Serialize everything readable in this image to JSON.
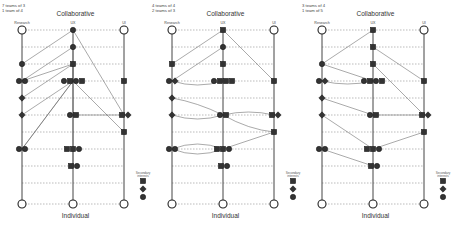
{
  "diagram": {
    "columns": [
      "Research",
      "UX",
      "UI"
    ],
    "top_label": "Collaborative",
    "bottom_label": "Individual",
    "legend": {
      "title": "Secondary interests",
      "shapes": [
        "square",
        "diamond",
        "circle"
      ]
    },
    "colors": {
      "node": "#333333",
      "line": "#555555",
      "dash": "#777777",
      "hollow_fill": "#ffffff"
    }
  },
  "panels": [
    {
      "teams_line1": "7 teams of 3",
      "teams_line2": "1 team of 4",
      "top_label": "Collaborative",
      "bottom_label": "Individual",
      "col_labels": [
        "Research",
        "UX",
        "UI"
      ],
      "legend_title": "Secondary interests",
      "nodes": [
        {
          "r": 1,
          "c": 1,
          "s": "circle",
          "dx": 0
        },
        {
          "r": 2,
          "c": 0,
          "s": "circle",
          "dx": 0
        },
        {
          "r": 2,
          "c": 1,
          "s": "square",
          "dx": 0
        },
        {
          "r": 3,
          "c": 0,
          "s": "circle",
          "dx": -3
        },
        {
          "r": 3,
          "c": 0,
          "s": "circle",
          "dx": 3
        },
        {
          "r": 3,
          "c": 1,
          "s": "circle",
          "dx": -9
        },
        {
          "r": 3,
          "c": 1,
          "s": "square",
          "dx": -3
        },
        {
          "r": 3,
          "c": 1,
          "s": "circle",
          "dx": 3
        },
        {
          "r": 3,
          "c": 1,
          "s": "square",
          "dx": 9
        },
        {
          "r": 3,
          "c": 2,
          "s": "square",
          "dx": 0
        },
        {
          "r": 4,
          "c": 0,
          "s": "diamond",
          "dx": 0
        },
        {
          "r": 5,
          "c": 0,
          "s": "diamond",
          "dx": 0
        },
        {
          "r": 5,
          "c": 1,
          "s": "circle",
          "dx": -3
        },
        {
          "r": 5,
          "c": 1,
          "s": "square",
          "dx": 3
        },
        {
          "r": 5,
          "c": 2,
          "s": "square",
          "dx": -2
        },
        {
          "r": 5,
          "c": 2,
          "s": "diamond",
          "dx": 4
        },
        {
          "r": 6,
          "c": 2,
          "s": "square",
          "dx": 0
        },
        {
          "r": 7,
          "c": 0,
          "s": "circle",
          "dx": -3
        },
        {
          "r": 7,
          "c": 0,
          "s": "circle",
          "dx": 3
        },
        {
          "r": 7,
          "c": 1,
          "s": "square",
          "dx": -6
        },
        {
          "r": 7,
          "c": 1,
          "s": "square",
          "dx": 0
        },
        {
          "r": 7,
          "c": 1,
          "s": "circle",
          "dx": 6
        },
        {
          "r": 8,
          "c": 1,
          "s": "square",
          "dx": -2
        },
        {
          "r": 8,
          "c": 1,
          "s": "circle",
          "dx": 4
        }
      ],
      "links": [
        {
          "a": [
            0,
            1
          ],
          "b": [
            2,
            0
          ]
        },
        {
          "a": [
            1,
            1
          ],
          "b": [
            3,
            0
          ]
        },
        {
          "a": [
            1,
            1
          ],
          "b": [
            3,
            1
          ]
        },
        {
          "a": [
            0,
            1
          ],
          "b": [
            5,
            2
          ]
        },
        {
          "a": [
            2,
            1
          ],
          "b": [
            3,
            0
          ]
        },
        {
          "a": [
            2,
            1
          ],
          "b": [
            4,
            0
          ]
        },
        {
          "a": [
            3,
            1
          ],
          "b": [
            6,
            2
          ]
        },
        {
          "a": [
            3,
            1
          ],
          "b": [
            5,
            0
          ]
        },
        {
          "a": [
            3,
            1
          ],
          "b": [
            7,
            0
          ]
        },
        {
          "a": [
            2,
            1
          ],
          "b": [
            8,
            1
          ]
        },
        {
          "a": [
            5,
            1
          ],
          "b": [
            5,
            2
          ]
        },
        {
          "a": [
            3,
            1
          ],
          "b": [
            7,
            0
          ]
        }
      ]
    },
    {
      "teams_line1": "4 teams of 4",
      "teams_line2": "2 teams of 3",
      "top_label": "Collaborative",
      "bottom_label": "Individual",
      "col_labels": [
        "Research",
        "UX",
        "UI"
      ],
      "legend_title": "Secondary interests",
      "nodes": [
        {
          "r": 1,
          "c": 1,
          "s": "circle",
          "dx": 0
        },
        {
          "r": 2,
          "c": 0,
          "s": "square",
          "dx": 0
        },
        {
          "r": 2,
          "c": 1,
          "s": "square",
          "dx": 0
        },
        {
          "r": 3,
          "c": 0,
          "s": "circle",
          "dx": -3
        },
        {
          "r": 3,
          "c": 0,
          "s": "diamond",
          "dx": 3
        },
        {
          "r": 3,
          "c": 1,
          "s": "circle",
          "dx": -9
        },
        {
          "r": 3,
          "c": 1,
          "s": "square",
          "dx": -3
        },
        {
          "r": 3,
          "c": 1,
          "s": "square",
          "dx": 3
        },
        {
          "r": 3,
          "c": 1,
          "s": "square",
          "dx": 9
        },
        {
          "r": 3,
          "c": 2,
          "s": "square",
          "dx": 0
        },
        {
          "r": 4,
          "c": 0,
          "s": "diamond",
          "dx": 0
        },
        {
          "r": 5,
          "c": 0,
          "s": "diamond",
          "dx": 0
        },
        {
          "r": 5,
          "c": 1,
          "s": "circle",
          "dx": -3
        },
        {
          "r": 5,
          "c": 1,
          "s": "square",
          "dx": 3
        },
        {
          "r": 5,
          "c": 2,
          "s": "square",
          "dx": -2
        },
        {
          "r": 5,
          "c": 2,
          "s": "diamond",
          "dx": 4
        },
        {
          "r": 6,
          "c": 2,
          "s": "square",
          "dx": 0
        },
        {
          "r": 7,
          "c": 0,
          "s": "circle",
          "dx": -3
        },
        {
          "r": 7,
          "c": 0,
          "s": "circle",
          "dx": 3
        },
        {
          "r": 7,
          "c": 1,
          "s": "square",
          "dx": -6
        },
        {
          "r": 7,
          "c": 1,
          "s": "square",
          "dx": 0
        },
        {
          "r": 7,
          "c": 1,
          "s": "circle",
          "dx": 6
        },
        {
          "r": 8,
          "c": 1,
          "s": "square",
          "dx": -2
        },
        {
          "r": 8,
          "c": 1,
          "s": "circle",
          "dx": 4
        }
      ],
      "links": [
        {
          "a": [
            0,
            1
          ],
          "b": [
            2,
            0
          ]
        },
        {
          "a": [
            1,
            1
          ],
          "b": [
            3,
            0
          ]
        },
        {
          "a": [
            0,
            1
          ],
          "b": [
            3,
            2
          ]
        },
        {
          "a": [
            3,
            0
          ],
          "b": [
            3,
            1
          ],
          "curve": 8
        },
        {
          "a": [
            4,
            0
          ],
          "b": [
            5,
            1
          ],
          "curve": -4
        },
        {
          "a": [
            5,
            1
          ],
          "b": [
            5,
            2
          ],
          "curve": -6
        },
        {
          "a": [
            5,
            0
          ],
          "b": [
            5,
            1
          ],
          "curve": 8
        },
        {
          "a": [
            5,
            1
          ],
          "b": [
            6,
            2
          ],
          "curve": 6
        },
        {
          "a": [
            7,
            0
          ],
          "b": [
            7,
            1
          ],
          "curve": -10
        },
        {
          "a": [
            7,
            0
          ],
          "b": [
            7,
            1
          ],
          "curve": 10
        },
        {
          "a": [
            6,
            2
          ],
          "b": [
            7,
            1
          ]
        }
      ]
    },
    {
      "teams_line1": "3 teams of 4",
      "teams_line2": "1 team of 5",
      "top_label": "Collaborative",
      "bottom_label": "Individual",
      "col_labels": [
        "Research",
        "UX",
        "UI"
      ],
      "legend_title": "Secondary interests",
      "nodes": [
        {
          "r": 1,
          "c": 1,
          "s": "square",
          "dx": 0
        },
        {
          "r": 2,
          "c": 0,
          "s": "circle",
          "dx": 0
        },
        {
          "r": 2,
          "c": 1,
          "s": "square",
          "dx": 0
        },
        {
          "r": 3,
          "c": 0,
          "s": "circle",
          "dx": -3
        },
        {
          "r": 3,
          "c": 0,
          "s": "diamond",
          "dx": 3
        },
        {
          "r": 3,
          "c": 1,
          "s": "circle",
          "dx": -9
        },
        {
          "r": 3,
          "c": 1,
          "s": "square",
          "dx": -3
        },
        {
          "r": 3,
          "c": 1,
          "s": "circle",
          "dx": 3
        },
        {
          "r": 3,
          "c": 1,
          "s": "square",
          "dx": 9
        },
        {
          "r": 3,
          "c": 2,
          "s": "square",
          "dx": 0
        },
        {
          "r": 4,
          "c": 0,
          "s": "diamond",
          "dx": 0
        },
        {
          "r": 5,
          "c": 0,
          "s": "diamond",
          "dx": 0
        },
        {
          "r": 5,
          "c": 1,
          "s": "circle",
          "dx": -3
        },
        {
          "r": 5,
          "c": 1,
          "s": "square",
          "dx": 3
        },
        {
          "r": 5,
          "c": 2,
          "s": "square",
          "dx": -2
        },
        {
          "r": 5,
          "c": 2,
          "s": "diamond",
          "dx": 4
        },
        {
          "r": 6,
          "c": 2,
          "s": "square",
          "dx": 0
        },
        {
          "r": 7,
          "c": 0,
          "s": "circle",
          "dx": -3
        },
        {
          "r": 7,
          "c": 0,
          "s": "circle",
          "dx": 3
        },
        {
          "r": 7,
          "c": 1,
          "s": "square",
          "dx": -6
        },
        {
          "r": 7,
          "c": 1,
          "s": "square",
          "dx": 0
        },
        {
          "r": 7,
          "c": 1,
          "s": "circle",
          "dx": 6
        },
        {
          "r": 8,
          "c": 1,
          "s": "square",
          "dx": -2
        },
        {
          "r": 8,
          "c": 1,
          "s": "circle",
          "dx": 4
        }
      ],
      "links": [
        {
          "a": [
            0,
            1
          ],
          "b": [
            2,
            0
          ]
        },
        {
          "a": [
            1,
            1
          ],
          "b": [
            3,
            2
          ]
        },
        {
          "a": [
            2,
            1
          ],
          "b": [
            5,
            2
          ]
        },
        {
          "a": [
            3,
            0
          ],
          "b": [
            3,
            1
          ],
          "curve": 6
        },
        {
          "a": [
            2,
            0
          ],
          "b": [
            3,
            1
          ]
        },
        {
          "a": [
            4,
            0
          ],
          "b": [
            5,
            1
          ]
        },
        {
          "a": [
            5,
            0
          ],
          "b": [
            7,
            1
          ]
        },
        {
          "a": [
            5,
            1
          ],
          "b": [
            5,
            2
          ]
        },
        {
          "a": [
            6,
            2
          ],
          "b": [
            7,
            1
          ]
        },
        {
          "a": [
            7,
            0
          ],
          "b": [
            8,
            1
          ]
        }
      ]
    }
  ],
  "layout": {
    "panel_x": [
      0,
      150,
      300
    ],
    "col_x": [
      22,
      73,
      124
    ],
    "row_y": [
      30,
      47,
      64,
      81,
      98,
      115,
      132,
      149,
      166,
      183,
      204
    ]
  }
}
